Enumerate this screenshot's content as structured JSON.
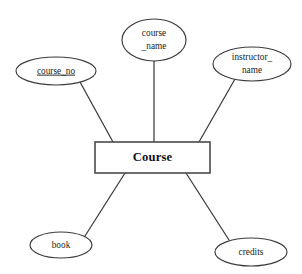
{
  "diagram": {
    "type": "entity-relationship-diagram",
    "notation": "chen",
    "background_color": "#ffffff",
    "line_color": "#3b3b3f",
    "text_color": "#1d1d20",
    "entity": {
      "name": "Course",
      "label": "Course",
      "shape": "rectangle",
      "x": 95,
      "y": 142,
      "width": 115,
      "height": 31
    },
    "attributes": [
      {
        "id": "course_no",
        "label": "course_no",
        "lines": [
          "course_no"
        ],
        "is_key": true,
        "underlined": true,
        "shape": "ellipse",
        "cx": 56,
        "cy": 71,
        "rx": 40,
        "ry": 14,
        "connector": {
          "x1": 80,
          "y1": 82,
          "x2": 113,
          "y2": 142
        }
      },
      {
        "id": "course_name",
        "label": "course_name",
        "lines": [
          "course",
          "_name"
        ],
        "is_key": false,
        "underlined": false,
        "shape": "ellipse",
        "cx": 154,
        "cy": 40,
        "rx": 32,
        "ry": 21,
        "connector": {
          "x1": 154,
          "y1": 61,
          "x2": 154,
          "y2": 142
        }
      },
      {
        "id": "instructor_name",
        "label": "instructor_name",
        "lines": [
          "instructor_",
          "name"
        ],
        "is_key": false,
        "underlined": false,
        "shape": "ellipse",
        "cx": 252,
        "cy": 64,
        "rx": 39,
        "ry": 17,
        "connector": {
          "x1": 235,
          "y1": 79,
          "x2": 199,
          "y2": 142
        }
      },
      {
        "id": "book",
        "label": "book",
        "lines": [
          "book"
        ],
        "is_key": false,
        "underlined": false,
        "shape": "ellipse",
        "cx": 61,
        "cy": 245,
        "rx": 31,
        "ry": 13,
        "connector": {
          "x1": 85,
          "y1": 236,
          "x2": 125,
          "y2": 173
        }
      },
      {
        "id": "credits",
        "label": "credits",
        "lines": [
          "credits"
        ],
        "is_key": false,
        "underlined": false,
        "shape": "ellipse",
        "cx": 251,
        "cy": 252,
        "rx": 36,
        "ry": 14,
        "connector": {
          "x1": 229,
          "y1": 240,
          "x2": 186,
          "y2": 173
        }
      }
    ]
  }
}
